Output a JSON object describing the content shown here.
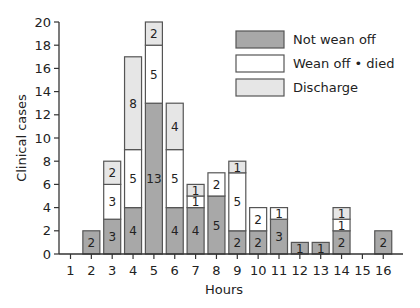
{
  "chart_data": {
    "type": "bar",
    "stacked": true,
    "title": "",
    "xlabel": "Hours",
    "ylabel": "Clinical cases",
    "ylim": [
      0,
      20
    ],
    "yticks": [
      0,
      2,
      4,
      6,
      8,
      10,
      12,
      14,
      16,
      18,
      20
    ],
    "grid": false,
    "legend_position": "upper right",
    "categories": [
      "1",
      "2",
      "3",
      "4",
      "5",
      "6",
      "7",
      "8",
      "9",
      "10",
      "11",
      "12",
      "13",
      "14",
      "15",
      "16"
    ],
    "series": [
      {
        "name": "Not wean off",
        "color": "#a8a8a8",
        "values": [
          0,
          2,
          3,
          4,
          13,
          4,
          4,
          5,
          2,
          2,
          3,
          1,
          1,
          2,
          0,
          2
        ]
      },
      {
        "name": "Wean off • died",
        "color": "#ffffff",
        "values": [
          0,
          0,
          3,
          5,
          5,
          5,
          1,
          2,
          5,
          2,
          1,
          0,
          0,
          1,
          0,
          0
        ]
      },
      {
        "name": "Discharge",
        "color": "#e6e6e6",
        "values": [
          0,
          0,
          2,
          8,
          2,
          4,
          1,
          0,
          1,
          0,
          0,
          0,
          0,
          1,
          0,
          0
        ]
      }
    ]
  }
}
